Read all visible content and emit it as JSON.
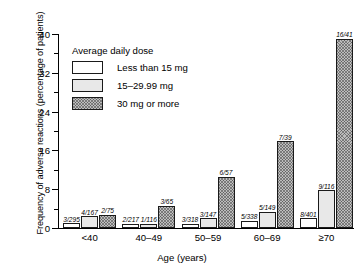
{
  "chart_data": {
    "type": "bar",
    "title": "",
    "xlabel": "Age (years)",
    "ylabel": "Frequency of adverse reactions (percentage of patients)",
    "ylim": [
      0,
      40
    ],
    "yticks": [
      0,
      8,
      16,
      24,
      32,
      40
    ],
    "yticks_minor": [
      4,
      12,
      20,
      28,
      36
    ],
    "grid": false,
    "legend_position": "upper-left-inside",
    "legend_title": "Average daily dose",
    "categories": [
      "<40",
      "40–49",
      "50–59",
      "60–69",
      "≥70"
    ],
    "series": [
      {
        "name": "Less than 15 mg",
        "values": [
          1.0,
          0.9,
          0.9,
          1.5,
          2.0
        ],
        "annotations": [
          "3/295",
          "2/217",
          "3/318",
          "5/338",
          "8/401"
        ]
      },
      {
        "name": "15–29.99 mg",
        "values": [
          2.4,
          0.9,
          2.0,
          3.4,
          7.8
        ],
        "annotations": [
          "4/167",
          "1/116",
          "3/147",
          "5/149",
          "9/116"
        ]
      },
      {
        "name": "30 mg or more",
        "values": [
          2.7,
          4.6,
          10.5,
          17.9,
          39.0
        ],
        "annotations": [
          "2/75",
          "3/65",
          "6/57",
          "7/39",
          "16/41"
        ]
      }
    ]
  },
  "axis": {
    "y_tick_labels": [
      "0",
      "8",
      "16",
      "24",
      "32",
      "40"
    ],
    "x_tick_labels": [
      "<40",
      "40–49",
      "50–59",
      "60–69",
      "≥70"
    ],
    "y_title": "Frequency of adverse reactions (percentage of patients)",
    "x_title": "Age (years)"
  },
  "legend": {
    "title": "Average daily dose",
    "items": [
      {
        "label": "Less than 15 mg",
        "key": "dose-a"
      },
      {
        "label": "15–29.99 mg",
        "key": "dose-b"
      },
      {
        "label": "30 mg or more",
        "key": "dose-c"
      }
    ]
  },
  "colors": {
    "axis": "#000000",
    "bar_outline": "#1a1a1a",
    "dose_a_fill": "#ffffff",
    "dose_b_fill": "#e8e8e8",
    "dose_c_fill": "#bdbdbd"
  }
}
